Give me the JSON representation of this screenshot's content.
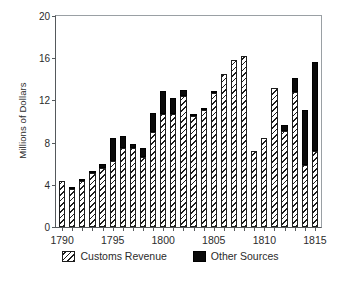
{
  "chart_data": {
    "type": "bar",
    "stacked": true,
    "title": "",
    "xlabel": "",
    "ylabel": "Millions of Dollars",
    "xlim": [
      1789.4,
      1815.6
    ],
    "ylim": [
      0,
      20
    ],
    "ytick_labels": [
      "0",
      "4",
      "8",
      "12",
      "16",
      "20"
    ],
    "ytick_values": [
      0,
      4,
      8,
      12,
      16,
      20
    ],
    "xtick_labels": [
      "1790",
      "1795",
      "1800",
      "1805",
      "1810",
      "1815"
    ],
    "xtick_values": [
      1790,
      1795,
      1800,
      1805,
      1810,
      1815
    ],
    "grid": false,
    "legend_position": "below",
    "categories": [
      1790,
      1791,
      1792,
      1793,
      1794,
      1795,
      1796,
      1797,
      1798,
      1799,
      1800,
      1801,
      1802,
      1803,
      1804,
      1805,
      1806,
      1807,
      1808,
      1809,
      1810,
      1811,
      1812,
      1813,
      1814,
      1815
    ],
    "series": [
      {
        "name": "Customs Revenue",
        "style": "hatched",
        "color": "#ffffff",
        "values": [
          4.4,
          3.6,
          4.4,
          5.1,
          5.6,
          6.3,
          7.5,
          7.5,
          6.6,
          9.0,
          10.7,
          10.7,
          12.4,
          10.5,
          11.1,
          12.7,
          14.5,
          15.8,
          16.2,
          7.2,
          8.4,
          13.2,
          9.1,
          12.8,
          5.9,
          7.2
        ]
      },
      {
        "name": "Other Sources",
        "style": "solid",
        "color": "#0a0a0a",
        "values": [
          0.0,
          0.1,
          0.1,
          0.2,
          0.4,
          2.1,
          1.1,
          0.4,
          0.9,
          1.8,
          2.2,
          1.5,
          0.6,
          0.1,
          0.1,
          0.1,
          0.0,
          0.0,
          0.0,
          0.0,
          0.0,
          0.0,
          0.6,
          1.3,
          5.2,
          8.4
        ]
      }
    ],
    "totals": [
      4.4,
      3.7,
      4.5,
      5.3,
      6.0,
      8.4,
      8.6,
      7.9,
      7.5,
      10.8,
      12.9,
      12.2,
      13.0,
      10.6,
      11.2,
      12.8,
      14.5,
      15.8,
      16.2,
      7.2,
      8.4,
      13.2,
      9.7,
      14.1,
      11.1,
      15.6
    ]
  },
  "legend": {
    "items": [
      {
        "label": "Customs Revenue",
        "swatch": "hatched-swatch"
      },
      {
        "label": "Other Sources",
        "swatch": "solid-black-swatch"
      }
    ]
  }
}
